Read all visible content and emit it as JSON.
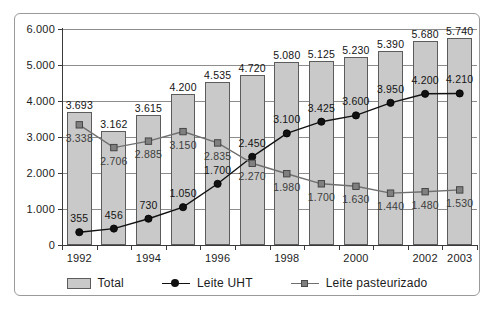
{
  "chart_data": {
    "type": "bar",
    "title": "",
    "subtitle": "",
    "xlabel": "",
    "ylabel": "",
    "ylim": [
      0,
      6000
    ],
    "ytick_labels": [
      "0",
      "1.000",
      "2.000",
      "3.000",
      "4.000",
      "5.000",
      "6.000"
    ],
    "ytick_values": [
      0,
      1000,
      2000,
      3000,
      4000,
      5000,
      6000
    ],
    "grid": true,
    "legend_position": "bottom",
    "categories": [
      "1992",
      "1993",
      "1994",
      "1995",
      "1996",
      "1997",
      "1998",
      "1999",
      "2000",
      "2001",
      "2002",
      "2003"
    ],
    "xtick_labels_shown": [
      "1992",
      "1994",
      "1996",
      "1998",
      "2000",
      "2002",
      "2003"
    ],
    "series": [
      {
        "name": "Total",
        "render": "bar",
        "color": "#c9c9c9",
        "edge_color": "#5c5c5c",
        "values": [
          3693,
          3162,
          3615,
          4200,
          4535,
          4720,
          5080,
          5125,
          5230,
          5390,
          5680,
          5740
        ],
        "labels": [
          "3.693",
          "3.162",
          "3.615",
          "4.200",
          "4.535",
          "4.720",
          "5.080",
          "5.125",
          "5.230",
          "5.390",
          "5.680",
          "5.740"
        ]
      },
      {
        "name": "Leite UHT",
        "render": "line",
        "marker": "circle",
        "color": "#111111",
        "values": [
          355,
          456,
          730,
          1050,
          1700,
          2450,
          3100,
          3425,
          3600,
          3950,
          4200,
          4210
        ],
        "labels": [
          "355",
          "456",
          "730",
          "1.050",
          "1.700",
          "2.450",
          "3.100",
          "3.425",
          "3.600",
          "3.950",
          "4.200",
          "4.210"
        ]
      },
      {
        "name": "Leite pasteurizado",
        "render": "line",
        "marker": "square",
        "color": "#6f6f6f",
        "values": [
          3338,
          2706,
          2885,
          3150,
          2835,
          2270,
          1980,
          1700,
          1630,
          1440,
          1480,
          1530
        ],
        "labels": [
          "3.338",
          "2.706",
          "2.885",
          "3.150",
          "2.835",
          "2.270",
          "1.980",
          "1.700",
          "1.630",
          "1.440",
          "1.480",
          "1.530"
        ]
      }
    ]
  },
  "legend": {
    "items": [
      {
        "label": "Total",
        "marker": "filled-rect-swatch"
      },
      {
        "label": "Leite UHT",
        "marker": "line-circle-swatch"
      },
      {
        "label": "Leite pasteurizado",
        "marker": "line-square-swatch"
      }
    ]
  }
}
